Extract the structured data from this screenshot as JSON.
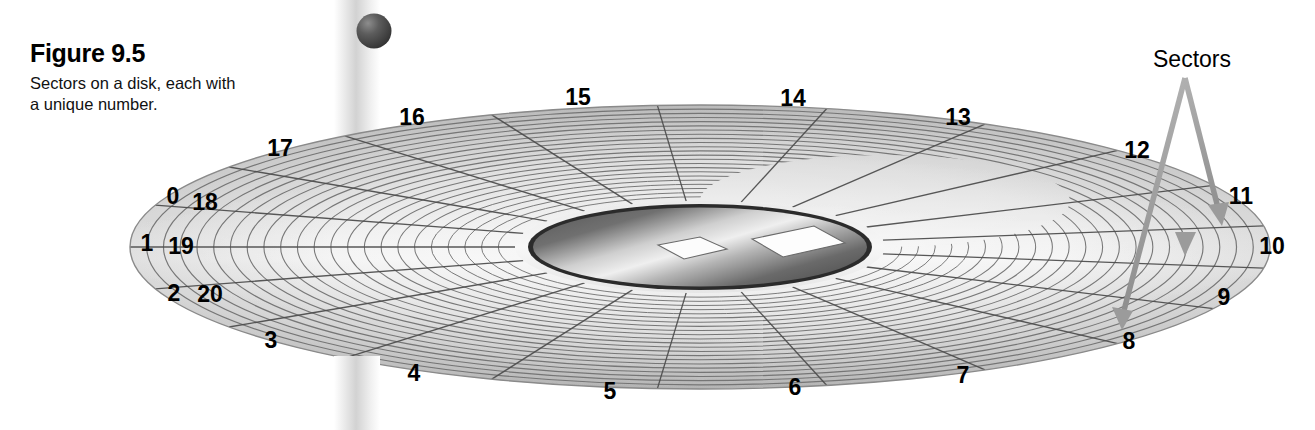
{
  "figure": {
    "title": "Figure 9.5",
    "subtitle": "Sectors on a disk, each with a unique number.",
    "rule_line": "horizontal-rule",
    "bullet": "sphere-bullet"
  },
  "annotation": {
    "sectors_label": "Sectors",
    "arrow_count": 3
  },
  "colors": {
    "disk_light": "#f2f2f2",
    "disk_mid": "#d9d9d9",
    "disk_dark": "#a8a8a8",
    "track_line": "#6b6b6b",
    "sector_line": "#555555",
    "hub_dark": "#3b3b3b",
    "hub_light": "#e8e8e8",
    "arrow": "#9a9a9a",
    "bar": "#d0d0d0",
    "sphere": "#4a4a4a",
    "text": "#000000"
  },
  "disk": {
    "geometry": {
      "center_x": 700,
      "center_y": 247,
      "outer_rx": 570,
      "outer_ry": 142,
      "inner_rx": 185,
      "inner_ry": 46,
      "hub_rx": 172,
      "hub_ry": 43,
      "track_count": 22
    },
    "sector_numbers": [
      {
        "label": "0",
        "x": 173,
        "y": 196
      },
      {
        "label": "18",
        "x": 205,
        "y": 202
      },
      {
        "label": "1",
        "x": 147,
        "y": 243
      },
      {
        "label": "19",
        "x": 181,
        "y": 246
      },
      {
        "label": "2",
        "x": 174,
        "y": 293
      },
      {
        "label": "20",
        "x": 210,
        "y": 294
      },
      {
        "label": "3",
        "x": 271,
        "y": 340
      },
      {
        "label": "4",
        "x": 414,
        "y": 373
      },
      {
        "label": "5",
        "x": 610,
        "y": 391
      },
      {
        "label": "6",
        "x": 795,
        "y": 387
      },
      {
        "label": "7",
        "x": 963,
        "y": 375
      },
      {
        "label": "8",
        "x": 1129,
        "y": 341
      },
      {
        "label": "9",
        "x": 1224,
        "y": 297
      },
      {
        "label": "10",
        "x": 1272,
        "y": 246
      },
      {
        "label": "11",
        "x": 1241,
        "y": 196
      },
      {
        "label": "12",
        "x": 1137,
        "y": 150
      },
      {
        "label": "13",
        "x": 958,
        "y": 117
      },
      {
        "label": "14",
        "x": 793,
        "y": 98
      },
      {
        "label": "15",
        "x": 578,
        "y": 97
      },
      {
        "label": "16",
        "x": 412,
        "y": 117
      },
      {
        "label": "17",
        "x": 280,
        "y": 148
      }
    ]
  },
  "chart_data": {
    "type": "diagram",
    "title": "Figure 9.5",
    "description": "Sectors on a disk, each with a unique number.",
    "sectors": [
      "0",
      "1",
      "2",
      "3",
      "4",
      "5",
      "6",
      "7",
      "8",
      "9",
      "10",
      "11",
      "12",
      "13",
      "14",
      "15",
      "16",
      "17",
      "18",
      "19",
      "20"
    ],
    "sector_count": 21,
    "annotations": [
      "Sectors"
    ]
  }
}
